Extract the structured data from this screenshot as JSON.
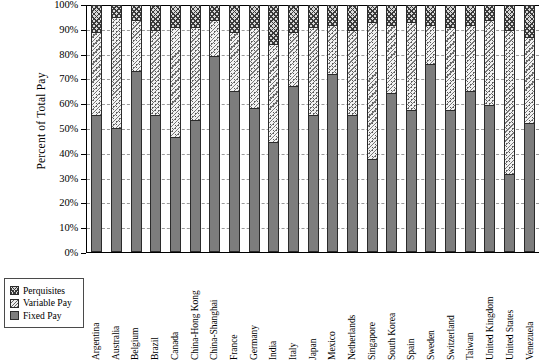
{
  "chart_data": {
    "type": "bar",
    "subtype": "stacked-100-percent",
    "title": "",
    "xlabel": "",
    "ylabel": "Percent of Total Pay",
    "ylim": [
      0,
      100
    ],
    "ytick_labels": [
      "0%",
      "10%",
      "20%",
      "30%",
      "40%",
      "50%",
      "60%",
      "70%",
      "80%",
      "90%",
      "100%"
    ],
    "ytick_values": [
      0,
      10,
      20,
      30,
      40,
      50,
      60,
      70,
      80,
      90,
      100
    ],
    "grid": true,
    "grid_axis": "y",
    "legend_position": "bottom-left",
    "legend_order": [
      "Perquisites",
      "Variable Pay",
      "Fixed Pay"
    ],
    "stack_order_bottom_to_top": [
      "Fixed Pay",
      "Variable Pay",
      "Perquisites"
    ],
    "categories": [
      "Argentina",
      "Australia",
      "Belgium",
      "Brazil",
      "Canada",
      "China-Hong Kong",
      "China-Shanghai",
      "France",
      "Germany",
      "India",
      "Italy",
      "Japan",
      "Mexico",
      "Netherlands",
      "Singapore",
      "South Korea",
      "Spain",
      "Sweden",
      "Switzerland",
      "Taiwan",
      "United Kingdom",
      "United States",
      "Venezuela"
    ],
    "series": [
      {
        "name": "Fixed Pay",
        "color": "#7d7d7d",
        "pattern": "solid",
        "values": [
          55,
          50,
          73,
          55,
          46,
          53,
          79,
          65,
          58,
          44,
          67,
          55,
          72,
          55,
          37,
          64,
          57,
          76,
          57,
          65,
          59,
          31,
          52
        ]
      },
      {
        "name": "Variable Pay",
        "color": "#f3f3f3",
        "pattern": "dotted",
        "values": [
          34,
          45,
          21,
          35,
          45,
          38,
          15,
          24,
          33,
          40,
          22,
          36,
          20,
          35,
          56,
          28,
          36,
          16,
          34,
          27,
          35,
          59,
          35
        ]
      },
      {
        "name": "Perquisites",
        "color": "#d9d9d9",
        "pattern": "crosshatch",
        "values": [
          11,
          5,
          6,
          10,
          9,
          9,
          6,
          11,
          9,
          16,
          11,
          9,
          8,
          10,
          7,
          8,
          7,
          8,
          9,
          8,
          6,
          10,
          13
        ]
      }
    ]
  },
  "legend": {
    "items": [
      {
        "label": "Perquisites",
        "key": "perq"
      },
      {
        "label": "Variable Pay",
        "key": "var"
      },
      {
        "label": "Fixed Pay",
        "key": "fixed"
      }
    ]
  }
}
